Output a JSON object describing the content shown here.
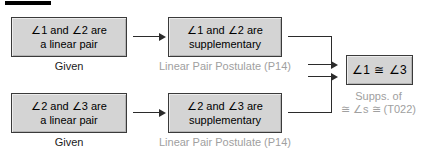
{
  "diagram": {
    "title_rule": "",
    "boxes": [
      {
        "id": "lp1",
        "line1": "∠1 and ∠2 are",
        "line2": "a linear pair",
        "caption": "Given",
        "caption_style": "dark"
      },
      {
        "id": "sup1",
        "line1": "∠1 and ∠2 are",
        "line2": "supplementary",
        "caption": "Linear Pair Postulate (P14)",
        "caption_style": "muted"
      },
      {
        "id": "lp2",
        "line1": "∠2 and ∠3 are",
        "line2": "a linear pair",
        "caption": "Given",
        "caption_style": "dark"
      },
      {
        "id": "sup2",
        "line1": "∠2 and ∠3 are",
        "line2": "supplementary",
        "caption": "Linear Pair Postulate (P14)",
        "caption_style": "muted"
      },
      {
        "id": "concl",
        "line1": "∠1 ≅ ∠3",
        "line2": "",
        "caption_line1": "Supps. of",
        "caption_line2": "≅ ∠s ≅ (T022)",
        "caption_style": "muted"
      }
    ],
    "colors": {
      "box_fill": "#d4d4d4",
      "box_border": "#3a3a3a",
      "connector": "#2b2b2b",
      "caption_dark": "#1a1a1a",
      "caption_muted": "#a0a0a0",
      "rule": "#000000",
      "background": "#ffffff"
    }
  }
}
